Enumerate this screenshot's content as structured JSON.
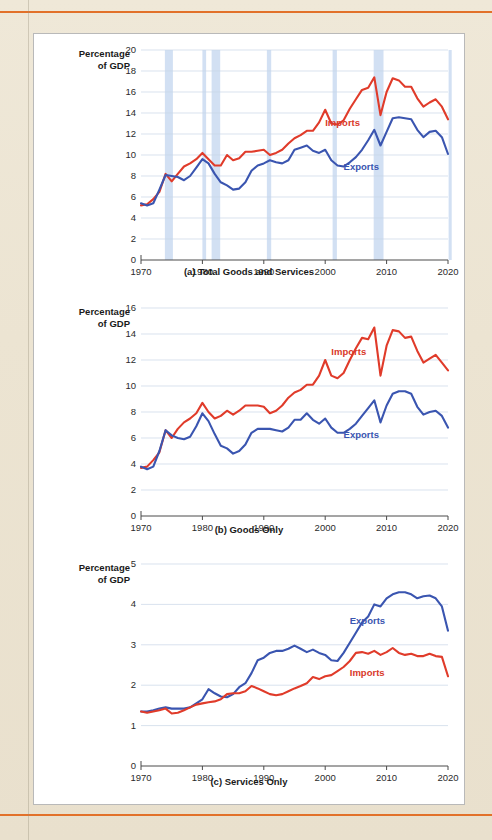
{
  "page": {
    "background_color": "#ece4d3",
    "rule_color": "#e2712a",
    "panel_background": "#ffffff"
  },
  "colors": {
    "imports": "#e03b2a",
    "exports": "#3a55b0",
    "recession_band": "#c3d6ef",
    "gridline": "#c9d6e6",
    "axis": "#4a4a4a"
  },
  "axis_title": "Percentage\nof GDP",
  "charts": [
    {
      "id": "a",
      "caption": "(a) Total Goods and Services",
      "type": "line",
      "xlabel": "",
      "ylabel": "Percentage of GDP",
      "xlim": [
        1970,
        2020
      ],
      "ylim": [
        0,
        20
      ],
      "yticks": [
        0,
        2,
        4,
        6,
        8,
        10,
        12,
        14,
        16,
        18,
        20
      ],
      "xticks": [
        1970,
        1980,
        1990,
        2000,
        2010,
        2020
      ],
      "grid": true,
      "legend_position": "inline-labels",
      "recessions": [
        [
          1973.9,
          1975.2
        ],
        [
          1980.0,
          1980.6
        ],
        [
          1981.5,
          1982.9
        ],
        [
          1990.5,
          1991.2
        ],
        [
          2001.2,
          2001.9
        ],
        [
          2007.9,
          2009.5
        ],
        [
          2020.1,
          2020.6
        ]
      ],
      "series": [
        {
          "name": "Imports",
          "color": "#e03b2a",
          "label_x": 2000,
          "label_y": 13.6,
          "x": [
            1970,
            1971,
            1972,
            1973,
            1974,
            1975,
            1976,
            1977,
            1978,
            1979,
            1980,
            1981,
            1982,
            1983,
            1984,
            1985,
            1986,
            1987,
            1988,
            1989,
            1990,
            1991,
            1992,
            1993,
            1994,
            1995,
            1996,
            1997,
            1998,
            1999,
            2000,
            2001,
            2002,
            2003,
            2004,
            2005,
            2006,
            2007,
            2008,
            2009,
            2010,
            2011,
            2012,
            2013,
            2014,
            2015,
            2016,
            2017,
            2018,
            2019,
            2020
          ],
          "values": [
            5.2,
            5.3,
            5.8,
            6.5,
            8.2,
            7.5,
            8.2,
            8.9,
            9.2,
            9.6,
            10.2,
            9.6,
            9.0,
            9.0,
            10.0,
            9.5,
            9.7,
            10.3,
            10.3,
            10.4,
            10.5,
            10.0,
            10.2,
            10.5,
            11.1,
            11.6,
            11.9,
            12.3,
            12.3,
            13.1,
            14.3,
            13.0,
            12.9,
            13.3,
            14.4,
            15.3,
            16.2,
            16.4,
            17.4,
            13.8,
            16.0,
            17.3,
            17.1,
            16.5,
            16.5,
            15.4,
            14.6,
            15.0,
            15.3,
            14.6,
            13.4
          ]
        },
        {
          "name": "Exports",
          "color": "#3a55b0",
          "label_x": 2003,
          "label_y": 9.4,
          "x": [
            1970,
            1971,
            1972,
            1973,
            1974,
            1975,
            1976,
            1977,
            1978,
            1979,
            1980,
            1981,
            1982,
            1983,
            1984,
            1985,
            1986,
            1987,
            1988,
            1989,
            1990,
            1991,
            1992,
            1993,
            1994,
            1995,
            1996,
            1997,
            1998,
            1999,
            2000,
            2001,
            2002,
            2003,
            2004,
            2005,
            2006,
            2007,
            2008,
            2009,
            2010,
            2011,
            2012,
            2013,
            2014,
            2015,
            2016,
            2017,
            2018,
            2019,
            2020
          ],
          "values": [
            5.4,
            5.2,
            5.4,
            6.7,
            8.1,
            8.0,
            7.9,
            7.6,
            8.0,
            8.8,
            9.6,
            9.2,
            8.2,
            7.4,
            7.1,
            6.7,
            6.8,
            7.4,
            8.5,
            9.0,
            9.2,
            9.5,
            9.3,
            9.2,
            9.5,
            10.5,
            10.7,
            10.9,
            10.4,
            10.2,
            10.5,
            9.5,
            9.0,
            8.9,
            9.3,
            9.8,
            10.5,
            11.4,
            12.4,
            10.9,
            12.2,
            13.5,
            13.6,
            13.5,
            13.4,
            12.4,
            11.7,
            12.2,
            12.3,
            11.7,
            10.1
          ]
        }
      ]
    },
    {
      "id": "b",
      "caption": "(b) Goods Only",
      "type": "line",
      "xlabel": "",
      "ylabel": "Percentage of GDP",
      "xlim": [
        1970,
        2020
      ],
      "ylim": [
        0,
        16
      ],
      "yticks": [
        0,
        2,
        4,
        6,
        8,
        10,
        12,
        14,
        16
      ],
      "xticks": [
        1970,
        1980,
        1990,
        2000,
        2010,
        2020
      ],
      "grid": true,
      "legend_position": "inline-labels",
      "recessions": [],
      "series": [
        {
          "name": "Imports",
          "color": "#e03b2a",
          "label_x": 2001,
          "label_y": 13.1,
          "x": [
            1970,
            1971,
            1972,
            1973,
            1974,
            1975,
            1976,
            1977,
            1978,
            1979,
            1980,
            1981,
            1982,
            1983,
            1984,
            1985,
            1986,
            1987,
            1988,
            1989,
            1990,
            1991,
            1992,
            1993,
            1994,
            1995,
            1996,
            1997,
            1998,
            1999,
            2000,
            2001,
            2002,
            2003,
            2004,
            2005,
            2006,
            2007,
            2008,
            2009,
            2010,
            2011,
            2012,
            2013,
            2014,
            2015,
            2016,
            2017,
            2018,
            2019,
            2020
          ],
          "values": [
            3.7,
            3.8,
            4.3,
            4.9,
            6.6,
            6.0,
            6.7,
            7.2,
            7.5,
            7.9,
            8.7,
            8.0,
            7.5,
            7.7,
            8.1,
            7.8,
            8.1,
            8.5,
            8.5,
            8.5,
            8.4,
            7.9,
            8.1,
            8.5,
            9.1,
            9.5,
            9.7,
            10.1,
            10.1,
            10.8,
            12.0,
            10.8,
            10.6,
            11.0,
            12.0,
            12.9,
            13.7,
            13.6,
            14.5,
            10.8,
            13.1,
            14.3,
            14.2,
            13.7,
            13.8,
            12.7,
            11.8,
            12.1,
            12.4,
            11.8,
            11.2
          ]
        },
        {
          "name": "Exports",
          "color": "#3a55b0",
          "label_x": 2003,
          "label_y": 6.7,
          "x": [
            1970,
            1971,
            1972,
            1973,
            1974,
            1975,
            1976,
            1977,
            1978,
            1979,
            1980,
            1981,
            1982,
            1983,
            1984,
            1985,
            1986,
            1987,
            1988,
            1989,
            1990,
            1991,
            1992,
            1993,
            1994,
            1995,
            1996,
            1997,
            1998,
            1999,
            2000,
            2001,
            2002,
            2003,
            2004,
            2005,
            2006,
            2007,
            2008,
            2009,
            2010,
            2011,
            2012,
            2013,
            2014,
            2015,
            2016,
            2017,
            2018,
            2019,
            2020
          ],
          "values": [
            3.8,
            3.6,
            3.8,
            5.0,
            6.6,
            6.2,
            6.0,
            5.9,
            6.1,
            6.9,
            7.9,
            7.3,
            6.3,
            5.4,
            5.2,
            4.8,
            5.0,
            5.5,
            6.4,
            6.7,
            6.7,
            6.7,
            6.6,
            6.5,
            6.8,
            7.4,
            7.4,
            7.9,
            7.4,
            7.1,
            7.5,
            6.8,
            6.4,
            6.4,
            6.7,
            7.1,
            7.7,
            8.3,
            8.9,
            7.2,
            8.5,
            9.4,
            9.6,
            9.6,
            9.4,
            8.4,
            7.8,
            8.0,
            8.1,
            7.7,
            6.8
          ]
        }
      ]
    },
    {
      "id": "c",
      "caption": "(c) Services Only",
      "type": "line",
      "xlabel": "",
      "ylabel": "Percentage of GDP",
      "xlim": [
        1970,
        2020
      ],
      "ylim": [
        0,
        5
      ],
      "yticks": [
        0,
        1,
        2,
        3,
        4,
        5
      ],
      "xticks": [
        1970,
        1980,
        1990,
        2000,
        2010,
        2020
      ],
      "grid": true,
      "legend_position": "inline-labels",
      "recessions": [],
      "series": [
        {
          "name": "Exports",
          "color": "#3a55b0",
          "label_x": 2004,
          "label_y": 3.75,
          "x": [
            1970,
            1971,
            1972,
            1973,
            1974,
            1975,
            1976,
            1977,
            1978,
            1979,
            1980,
            1981,
            1982,
            1983,
            1984,
            1985,
            1986,
            1987,
            1988,
            1989,
            1990,
            1991,
            1992,
            1993,
            1994,
            1995,
            1996,
            1997,
            1998,
            1999,
            2000,
            2001,
            2002,
            2003,
            2004,
            2005,
            2006,
            2007,
            2008,
            2009,
            2010,
            2011,
            2012,
            2013,
            2014,
            2015,
            2016,
            2017,
            2018,
            2019,
            2020
          ],
          "values": [
            1.35,
            1.35,
            1.38,
            1.42,
            1.45,
            1.42,
            1.42,
            1.42,
            1.45,
            1.55,
            1.65,
            1.9,
            1.8,
            1.72,
            1.7,
            1.78,
            1.95,
            2.05,
            2.3,
            2.62,
            2.68,
            2.8,
            2.85,
            2.85,
            2.9,
            2.98,
            2.9,
            2.82,
            2.88,
            2.8,
            2.75,
            2.62,
            2.6,
            2.8,
            3.05,
            3.3,
            3.55,
            3.7,
            4.0,
            3.95,
            4.15,
            4.25,
            4.3,
            4.3,
            4.25,
            4.15,
            4.2,
            4.22,
            4.15,
            3.95,
            3.35
          ]
        },
        {
          "name": "Imports",
          "color": "#e03b2a",
          "label_x": 2004,
          "label_y": 2.45,
          "x": [
            1970,
            1971,
            1972,
            1973,
            1974,
            1975,
            1976,
            1977,
            1978,
            1979,
            1980,
            1981,
            1982,
            1983,
            1984,
            1985,
            1986,
            1987,
            1988,
            1989,
            1990,
            1991,
            1992,
            1993,
            1994,
            1995,
            1996,
            1997,
            1998,
            1999,
            2000,
            2001,
            2002,
            2003,
            2004,
            2005,
            2006,
            2007,
            2008,
            2009,
            2010,
            2011,
            2012,
            2013,
            2014,
            2015,
            2016,
            2017,
            2018,
            2019,
            2020
          ],
          "values": [
            1.35,
            1.32,
            1.35,
            1.38,
            1.42,
            1.3,
            1.32,
            1.38,
            1.45,
            1.52,
            1.55,
            1.58,
            1.6,
            1.65,
            1.78,
            1.8,
            1.8,
            1.85,
            1.98,
            1.92,
            1.85,
            1.78,
            1.75,
            1.78,
            1.85,
            1.92,
            1.98,
            2.05,
            2.2,
            2.15,
            2.22,
            2.25,
            2.35,
            2.45,
            2.6,
            2.8,
            2.82,
            2.78,
            2.85,
            2.75,
            2.82,
            2.92,
            2.8,
            2.75,
            2.78,
            2.72,
            2.72,
            2.78,
            2.72,
            2.7,
            2.22
          ]
        }
      ]
    }
  ]
}
